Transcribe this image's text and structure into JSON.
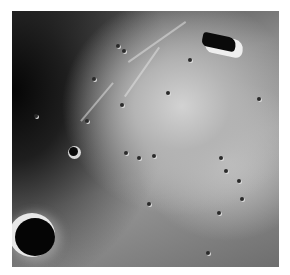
{
  "image": {
    "subject": "lunar surface photograph",
    "style": "grayscale",
    "features": [
      {
        "name": "large-crater",
        "position": "bottom-left"
      },
      {
        "name": "dark-shadowed-peak",
        "position": "top-right"
      },
      {
        "name": "small-crater",
        "position": "left-center"
      },
      {
        "name": "crater-cluster",
        "position": "top-left-center"
      },
      {
        "name": "bright-region",
        "position": "center-right"
      }
    ]
  }
}
